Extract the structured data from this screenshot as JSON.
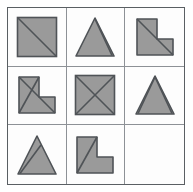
{
  "puzzle": {
    "type": "matrix-reasoning-3x3",
    "grid_rows": 3,
    "grid_cols": 3,
    "colors": {
      "shape_fill": "#9a9a9a",
      "shape_stroke": "#4f5357",
      "inner_line": "#4f5357",
      "grid_line": "#8d9196",
      "outer_border": "#5a5f63",
      "background": "#fdfdfd"
    },
    "cells": [
      {
        "index": 1,
        "position": "row1-col1",
        "shape": "square",
        "inner_lines": "diagonal-top-left-to-bottom-right",
        "line_count": 1,
        "empty": false,
        "label": ""
      },
      {
        "index": 2,
        "position": "row1-col2",
        "shape": "triangle",
        "inner_lines": "apex-to-bottom-right",
        "line_count": 1,
        "empty": false,
        "label": ""
      },
      {
        "index": 3,
        "position": "row1-col3",
        "shape": "l-shape",
        "inner_lines": "diagonal-top-left-to-bottom-right",
        "line_count": 1,
        "empty": false,
        "label": ""
      },
      {
        "index": 4,
        "position": "row2-col1",
        "shape": "l-shape",
        "inner_lines": "crossed-x",
        "line_count": 2,
        "empty": false,
        "label": ""
      },
      {
        "index": 5,
        "position": "row2-col2",
        "shape": "square",
        "inner_lines": "crossed-x",
        "line_count": 2,
        "empty": false,
        "label": ""
      },
      {
        "index": 6,
        "position": "row2-col3",
        "shape": "triangle",
        "inner_lines": "crossed-x",
        "line_count": 2,
        "empty": false,
        "label": ""
      },
      {
        "index": 7,
        "position": "row3-col1",
        "shape": "triangle",
        "inner_lines": "apex-to-bottom-left",
        "line_count": 1,
        "empty": false,
        "label": ""
      },
      {
        "index": 8,
        "position": "row3-col2",
        "shape": "l-shape",
        "inner_lines": "diagonal-top-right-to-bottom-left",
        "line_count": 1,
        "empty": false,
        "label": ""
      },
      {
        "index": 9,
        "position": "row3-col3",
        "shape": "none",
        "inner_lines": "none",
        "line_count": 0,
        "empty": true,
        "label": ""
      }
    ]
  }
}
